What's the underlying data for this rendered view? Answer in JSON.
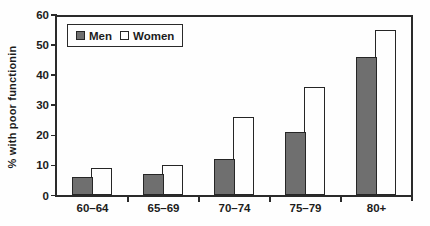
{
  "chart_data": {
    "type": "bar",
    "categories": [
      "60–64",
      "65–69",
      "70–74",
      "75–79",
      "80+"
    ],
    "series": [
      {
        "name": "Men",
        "values": [
          6,
          7,
          12,
          21,
          46
        ],
        "color": "#6f6f6f"
      },
      {
        "name": "Women",
        "values": [
          9,
          10,
          26,
          36,
          55
        ],
        "color": "#fefefe"
      }
    ],
    "title": "",
    "xlabel": "",
    "ylabel": "% with poor functionin",
    "ylim": [
      0,
      60
    ],
    "yticks": [
      0,
      10,
      20,
      30,
      40,
      50,
      60
    ],
    "grid": false,
    "legend_position": "top-left-inside",
    "colors": {
      "ink": "#2a2a2a",
      "men_fill": "#6f6f6f",
      "women_fill": "#fefefe",
      "background": "#fefefe"
    }
  }
}
